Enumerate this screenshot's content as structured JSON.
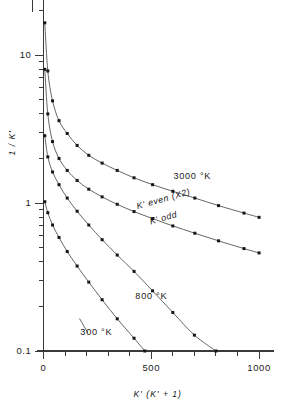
{
  "chart_data": {
    "type": "line",
    "title": "",
    "xlabel": "K' (K' + 1)",
    "ylabel": "1 / K'",
    "xscale": "linear",
    "yscale": "log",
    "xlim": [
      0,
      1060
    ],
    "ylim": [
      0.1,
      20
    ],
    "grid": false,
    "legend_position": "inline-annotations",
    "xticks_major": [
      0,
      500,
      1000
    ],
    "xticklabels": [
      "0",
      "500",
      "1000"
    ],
    "xticks_minor": [
      100,
      200,
      300,
      400,
      600,
      700,
      800,
      900
    ],
    "yticks_major": [
      0.1,
      1,
      10
    ],
    "yticklabels": [
      "0.1",
      "1",
      "10"
    ],
    "yticks_minor": [
      0.2,
      0.3,
      0.4,
      0.5,
      0.6,
      0.7,
      0.8,
      0.9,
      2,
      3,
      4,
      5,
      6,
      7,
      8,
      9,
      20
    ],
    "annotations": [
      {
        "text": "3000 °K",
        "x": 690,
        "y": 1.45,
        "rotation": 0
      },
      {
        "text": "K' even (X2)",
        "x": 560,
        "y": 1.02,
        "rotation": -16
      },
      {
        "text": "K' odd",
        "x": 560,
        "y": 0.76,
        "rotation": -16
      },
      {
        "text": "800 °K",
        "x": 500,
        "y": 0.225,
        "rotation": 0
      },
      {
        "text": "300 °K",
        "x": 245,
        "y": 0.128,
        "rotation": 0
      }
    ],
    "series": [
      {
        "name": "K' even (X2)",
        "temperature": "3000 °K",
        "marker": "square",
        "points": [
          [
            6,
            16.5
          ],
          [
            20,
            7.8
          ],
          [
            42,
            4.9
          ],
          [
            72,
            3.6
          ],
          [
            110,
            2.95
          ],
          [
            156,
            2.45
          ],
          [
            210,
            2.1
          ],
          [
            272,
            1.86
          ],
          [
            342,
            1.66
          ],
          [
            420,
            1.48
          ],
          [
            506,
            1.33
          ],
          [
            600,
            1.2
          ],
          [
            702,
            1.08
          ],
          [
            812,
            0.96
          ],
          [
            930,
            0.855
          ],
          [
            1000,
            0.8
          ]
        ]
      },
      {
        "name": "K' odd",
        "temperature": "3000 °K",
        "marker": "square",
        "points": [
          [
            6,
            8.0
          ],
          [
            20,
            4.0
          ],
          [
            42,
            2.6
          ],
          [
            72,
            2.0
          ],
          [
            110,
            1.66
          ],
          [
            156,
            1.42
          ],
          [
            210,
            1.24
          ],
          [
            272,
            1.1
          ],
          [
            342,
            0.98
          ],
          [
            420,
            0.875
          ],
          [
            506,
            0.785
          ],
          [
            600,
            0.7
          ],
          [
            702,
            0.625
          ],
          [
            812,
            0.555
          ],
          [
            930,
            0.492
          ],
          [
            1000,
            0.46
          ]
        ]
      },
      {
        "name": "800 °K",
        "temperature": "800 °K",
        "marker": "square",
        "points": [
          [
            6,
            2.85
          ],
          [
            20,
            2.05
          ],
          [
            42,
            1.62
          ],
          [
            72,
            1.33
          ],
          [
            110,
            1.08
          ],
          [
            156,
            0.88
          ],
          [
            210,
            0.71
          ],
          [
            272,
            0.565
          ],
          [
            342,
            0.445
          ],
          [
            420,
            0.345
          ],
          [
            506,
            0.255
          ],
          [
            600,
            0.182
          ],
          [
            700,
            0.128
          ],
          [
            800,
            0.1
          ]
        ]
      },
      {
        "name": "300 °K",
        "temperature": "300 °K",
        "marker": "square",
        "points": [
          [
            6,
            1.02
          ],
          [
            20,
            0.86
          ],
          [
            42,
            0.71
          ],
          [
            72,
            0.585
          ],
          [
            110,
            0.47
          ],
          [
            156,
            0.375
          ],
          [
            210,
            0.292
          ],
          [
            272,
            0.222
          ],
          [
            342,
            0.165
          ],
          [
            420,
            0.122
          ],
          [
            470,
            0.1
          ]
        ]
      }
    ]
  },
  "figure": {
    "axis_color": "#3a3a3a",
    "curve_color": "#4a4a4a",
    "marker_color": "#161616",
    "background": "#ffffff"
  }
}
